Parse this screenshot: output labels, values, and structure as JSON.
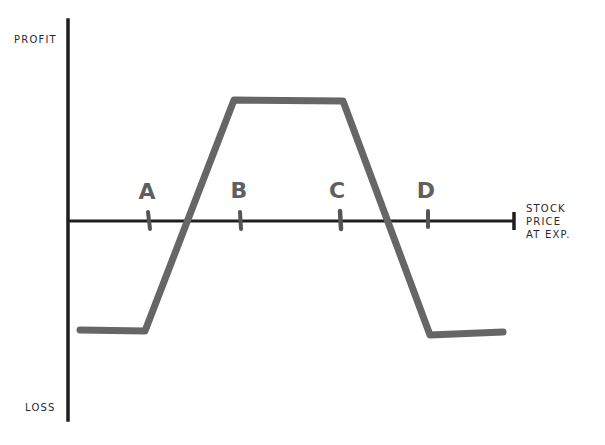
{
  "diagram": {
    "type": "options-payoff",
    "y_axis": {
      "top_label": "PROFIT",
      "bottom_label": "LOSS"
    },
    "x_axis": {
      "label": "STOCK\nPRICE\nAT EXP."
    },
    "strikes": [
      {
        "label": "A",
        "x": 147
      },
      {
        "label": "B",
        "x": 240
      },
      {
        "label": "C",
        "x": 340
      },
      {
        "label": "D",
        "x": 428
      }
    ],
    "payoff_path": [
      {
        "x": 80,
        "y": 330
      },
      {
        "x": 145,
        "y": 331
      },
      {
        "x": 234,
        "y": 100
      },
      {
        "x": 343,
        "y": 101
      },
      {
        "x": 430,
        "y": 335
      },
      {
        "x": 503,
        "y": 332
      }
    ],
    "colors": {
      "axis": "#1e1e1e",
      "payoff_line": "#666666",
      "strike_label": "#5f5f5f",
      "text": "#2a2a2a",
      "background": "#ffffff"
    }
  }
}
